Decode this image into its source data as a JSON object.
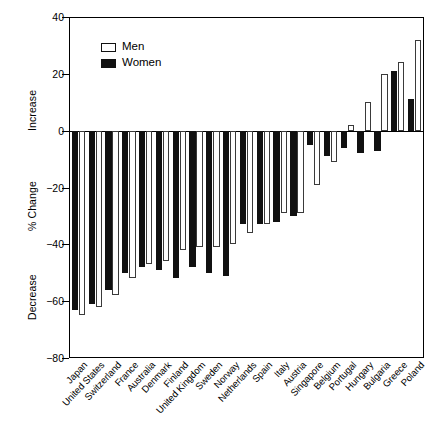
{
  "chart_data": {
    "type": "bar",
    "title": "",
    "xlabel": "",
    "ylabel": "% Change",
    "ylabel_upper": "Increase",
    "ylabel_lower": "Decrease",
    "ylim": [
      -80,
      40
    ],
    "yticks": [
      40,
      20,
      0,
      -20,
      -40,
      -60,
      -80
    ],
    "ytick_labels": [
      "40",
      "20",
      "0",
      "−20",
      "−40",
      "−60",
      "−80"
    ],
    "grid": false,
    "legend_position": "upper-left",
    "categories": [
      "Japan",
      "United States",
      "Switzerland",
      "France",
      "Australia",
      "Denmark",
      "Finland",
      "United Kingdom",
      "Sweden",
      "Norway",
      "Netherlands",
      "Spain",
      "Italy",
      "Austria",
      "Singapore",
      "Belgium",
      "Portugal",
      "Hungary",
      "Bulgaria",
      "Greece",
      "Poland"
    ],
    "series": [
      {
        "name": "Men",
        "color": "#ffffff",
        "edge_color": "#3a3a3a",
        "values": [
          -65,
          -62,
          -58,
          -52,
          -47,
          -46,
          -42,
          -41,
          -41,
          -40,
          -36,
          -33,
          -29,
          -29,
          -19,
          -11,
          2,
          10,
          20,
          24,
          32
        ]
      },
      {
        "name": "Women",
        "color": "#111111",
        "edge_color": "#111111",
        "values": [
          -63,
          -61,
          -56,
          -50,
          -48,
          -49,
          -52,
          -48,
          -50,
          -51,
          -33,
          -33,
          -32,
          -30,
          -5,
          -9,
          -6,
          -8,
          -7,
          21,
          11
        ]
      }
    ]
  },
  "legend": {
    "items": [
      {
        "label": "Men",
        "key": "men-swatch"
      },
      {
        "label": "Women",
        "key": "women-swatch"
      }
    ]
  },
  "axis": {
    "y_title": "% Change",
    "y_title_increase": "Increase",
    "y_title_decrease": "Decrease"
  }
}
